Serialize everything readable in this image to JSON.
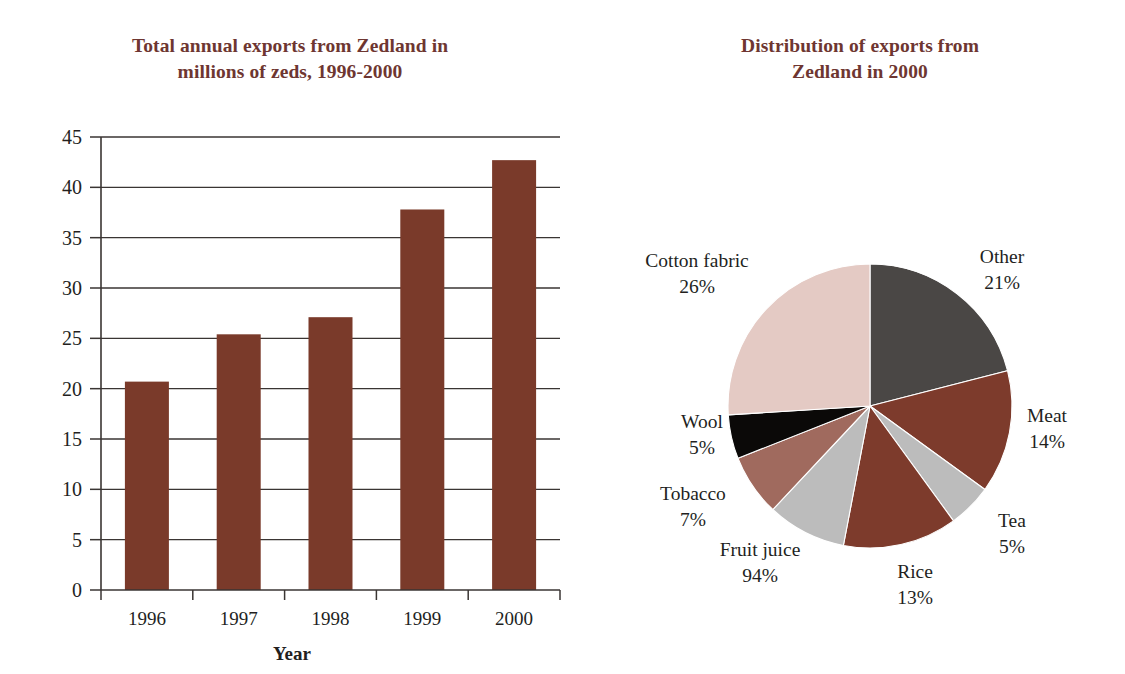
{
  "bar": {
    "title": "Total annual exports from Zedland in millions of zeds, 1996-2000",
    "title_line1": "Total annual exports from Zedland in",
    "title_line2": "millions of zeds, 1996-2000",
    "xlabel": "Year"
  },
  "pie": {
    "title": "Distribution of exports from Zedland in 2000",
    "title_line1": "Distribution of exports from",
    "title_line2": "Zedland in 2000"
  },
  "colors": {
    "title_maroon": "#6e3631",
    "bar_fill": "#7a3a2a",
    "axis_line": "#3a3533",
    "grid_line": "#3a3533",
    "text": "#231f1e",
    "slice_other": "#4a4745",
    "slice_meat": "#7d3b2c",
    "slice_tea": "#bcbcbc",
    "slice_rice": "#7d3b2c",
    "slice_fruit_juice": "#bcbcbc",
    "slice_tobacco": "#a06a5e",
    "slice_wool": "#0b0908",
    "slice_cotton_fabric": "#e4cac4"
  },
  "chart_data": [
    {
      "type": "bar",
      "title": "Total annual exports from Zedland in millions of zeds, 1996-2000",
      "xlabel": "Year",
      "ylabel": "",
      "categories": [
        "1996",
        "1997",
        "1998",
        "1999",
        "2000"
      ],
      "values": [
        20.7,
        25.4,
        27.1,
        37.8,
        42.7
      ],
      "ylim": [
        0,
        45
      ],
      "ytick_step": 5,
      "yticks": [
        "0",
        "5",
        "10",
        "15",
        "20",
        "25",
        "30",
        "35",
        "40",
        "45"
      ],
      "grid": true,
      "legend": "none",
      "series_color": "#7a3a2a"
    },
    {
      "type": "pie",
      "title": "Distribution of exports from Zedland in 2000",
      "start_angle_deg": 0,
      "direction": "clockwise",
      "legend": "labels-outside",
      "slices": [
        {
          "label": "Other",
          "value_text": "21%",
          "value": 21,
          "color": "#4a4745"
        },
        {
          "label": "Meat",
          "value_text": "14%",
          "value": 14,
          "color": "#7d3b2c"
        },
        {
          "label": "Tea",
          "value_text": "5%",
          "value": 5,
          "color": "#bcbcbc"
        },
        {
          "label": "Rice",
          "value_text": "13%",
          "value": 13,
          "color": "#7d3b2c"
        },
        {
          "label": "Fruit juice",
          "value_text": "94%",
          "value": 9,
          "color": "#bcbcbc"
        },
        {
          "label": "Tobacco",
          "value_text": "7%",
          "value": 7,
          "color": "#a06a5e"
        },
        {
          "label": "Wool",
          "value_text": "5%",
          "value": 5,
          "color": "#0b0908"
        },
        {
          "label": "Cotton fabric",
          "value_text": "26%",
          "value": 26,
          "color": "#e4cac4"
        }
      ]
    }
  ],
  "pie_labels": {
    "cotton_fabric_name": "Cotton fabric",
    "cotton_fabric_value": "26%",
    "other_name": "Other",
    "other_value": "21%",
    "meat_name": "Meat",
    "meat_value": "14%",
    "tea_name": "Tea",
    "tea_value": "5%",
    "rice_name": "Rice",
    "rice_value": "13%",
    "fruit_juice_name": "Fruit juice",
    "fruit_juice_value": "94%",
    "tobacco_name": "Tobacco",
    "tobacco_value": "7%",
    "wool_name": "Wool",
    "wool_value": "5%"
  },
  "bar_ticks": {
    "t0": "0",
    "t1": "5",
    "t2": "10",
    "t3": "15",
    "t4": "20",
    "t5": "25",
    "t6": "30",
    "t7": "35",
    "t8": "40",
    "t9": "45"
  },
  "bar_cats": {
    "c0": "1996",
    "c1": "1997",
    "c2": "1998",
    "c3": "1999",
    "c4": "2000"
  }
}
